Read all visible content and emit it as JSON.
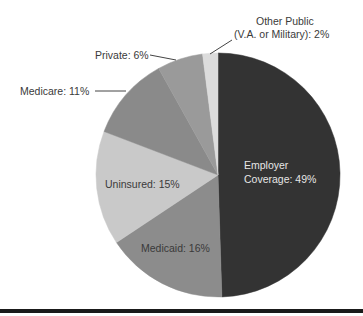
{
  "chart_data": {
    "type": "pie",
    "title": "",
    "start_angle_deg": 0,
    "direction": "clockwise",
    "slices": [
      {
        "label": "Employer Coverage",
        "value": 49,
        "display": "Employer Coverage: 49%",
        "color": "#333333"
      },
      {
        "label": "Medicaid",
        "value": 16,
        "display": "Medicaid: 16%",
        "color": "#8c8c8c"
      },
      {
        "label": "Uninsured",
        "value": 15,
        "display": "Uninsured: 15%",
        "color": "#c9c9c9"
      },
      {
        "label": "Medicare",
        "value": 11,
        "display": "Medicare: 11%",
        "color": "#8a8a8a"
      },
      {
        "label": "Private",
        "value": 6,
        "display": "Private: 6%",
        "color": "#9a9a9a"
      },
      {
        "label": "Other Public (V.A. or Military)",
        "value": 2,
        "display": "Other Public (V.A. or Military): 2%",
        "color": "#dcdcdc"
      }
    ],
    "legend": "none (direct labels)"
  },
  "labels": {
    "employer_line1": "Employer",
    "employer_line2": "Coverage: 49%",
    "medicaid": "Medicaid: 16%",
    "uninsured": "Uninsured: 15%",
    "medicare": "Medicare: 11%",
    "private": "Private: 6%",
    "other_line1": "Other Public",
    "other_line2": "(V.A. or Military): 2%"
  }
}
